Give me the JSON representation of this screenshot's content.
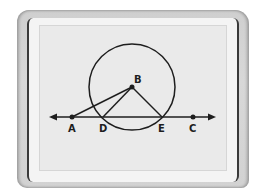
{
  "colors": {
    "frame": "#d2d2d2",
    "screen": "#eaeaea",
    "ink": "#1e1e1e"
  },
  "diagram": {
    "circle": {
      "center": "B",
      "cx": 132,
      "cy": 87,
      "r": 43
    },
    "line": {
      "from": "A",
      "to": "C",
      "y": 117,
      "x_start": 49,
      "x_end": 216,
      "arrows": "both"
    },
    "points": [
      {
        "name": "A",
        "label": "A",
        "x": 72,
        "y": 117
      },
      {
        "name": "B",
        "label": "B",
        "x": 132,
        "y": 87
      },
      {
        "name": "C",
        "label": "C",
        "x": 193,
        "y": 117
      },
      {
        "name": "D",
        "label": "D",
        "x": 103,
        "y": 117
      },
      {
        "name": "E",
        "label": "E",
        "x": 162,
        "y": 117
      }
    ],
    "segments": [
      {
        "from": "B",
        "to": "A"
      },
      {
        "from": "B",
        "to": "D"
      },
      {
        "from": "B",
        "to": "E"
      }
    ]
  },
  "labels": {
    "A": "A",
    "B": "B",
    "C": "C",
    "D": "D",
    "E": "E"
  }
}
